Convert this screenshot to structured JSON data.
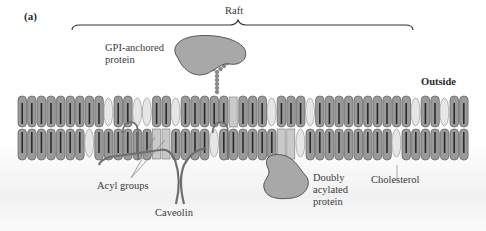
{
  "figure": {
    "panel_label": "(a)",
    "raft_label": "Raft",
    "side_label": "Outside",
    "labels": {
      "gpi_protein": [
        "GPI-anchored",
        "protein"
      ],
      "acyl_groups": "Acyl groups",
      "caveolin": "Caveolin",
      "doubly_acylated": [
        "Doubly",
        "acylated",
        "protein"
      ],
      "cholesterol": "Cholesterol"
    },
    "colors": {
      "lipid_head": "#9a9a9a",
      "lipid_outline": "#5f5f5f",
      "lipid_tail": "#2a2a2a",
      "cholesterol": "#e6e6e6",
      "protein": "#a8a8a8",
      "caveolin": "#7a7a7a"
    }
  }
}
